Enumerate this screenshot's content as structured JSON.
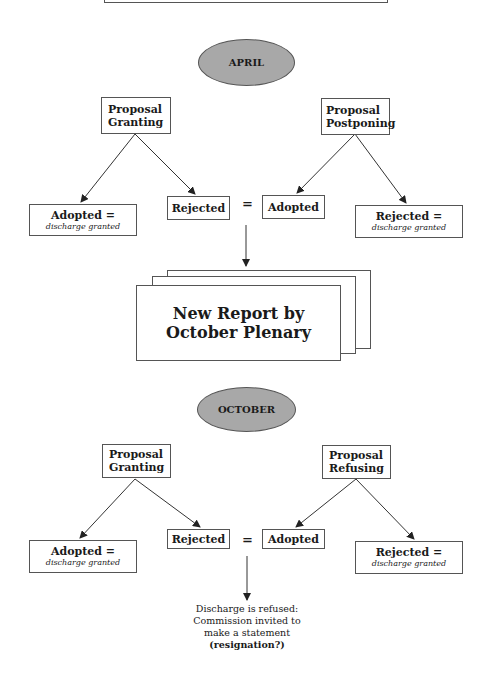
{
  "diagram": {
    "april": {
      "label": "APRIL",
      "proposal_left": {
        "line1": "Proposal",
        "line2": "Granting"
      },
      "proposal_right": {
        "line1": "Proposal",
        "line2": "Postponing"
      },
      "left_adopted": {
        "title": "Adopted =",
        "sub": "discharge granted"
      },
      "left_rejected": {
        "title": "Rejected"
      },
      "equals": "=",
      "right_adopted": {
        "title": "Adopted"
      },
      "right_rejected": {
        "title": "Rejected =",
        "sub": "discharge granted"
      }
    },
    "report": {
      "line1": "New Report by",
      "line2": "October Plenary"
    },
    "october": {
      "label": "OCTOBER",
      "proposal_left": {
        "line1": "Proposal",
        "line2": "Granting"
      },
      "proposal_right": {
        "line1": "Proposal",
        "line2": "Refusing"
      },
      "left_adopted": {
        "title": "Adopted =",
        "sub": "discharge granted"
      },
      "left_rejected": {
        "title": "Rejected"
      },
      "equals": "=",
      "right_adopted": {
        "title": "Adopted"
      },
      "right_rejected": {
        "title": "Rejected =",
        "sub": "discharge granted"
      }
    },
    "outcome": {
      "line1": "Discharge is refused:",
      "line2": "Commission invited to",
      "line3": "make a statement",
      "line4": "(resignation?)"
    },
    "colors": {
      "ellipse_fill": "#a8a8a8",
      "line": "#333333",
      "border": "#555555"
    }
  }
}
